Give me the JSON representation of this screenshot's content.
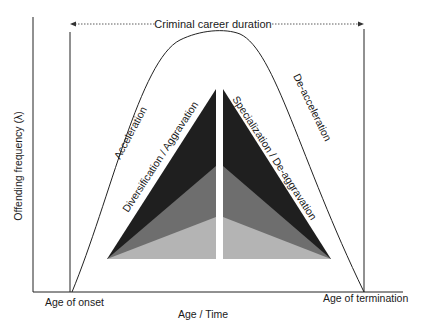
{
  "diagram": {
    "title_arrow_label": "Criminal career duration",
    "y_axis_label": "Offending frequency (λ)",
    "x_axis_label": "Age / Time",
    "x_start_label": "Age of onset",
    "x_end_label": "Age of termination",
    "curve_left_label": "Acceleration",
    "curve_right_label": "De-acceleration",
    "left_wedge_label": "Diversification / Aggravation",
    "right_wedge_label": "Specialization / De-aggravation",
    "colors": {
      "dark": "#1f1f1f",
      "mid": "#6e6e6e",
      "light": "#b4b4b4",
      "line": "#222222"
    }
  }
}
